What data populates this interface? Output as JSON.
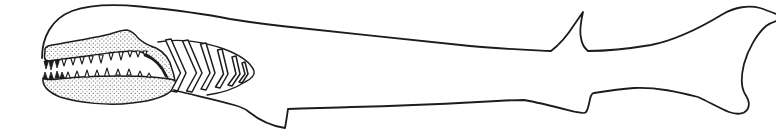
{
  "figure": {
    "kind": "black-and-white scientific line drawing",
    "background_color": "#ffffff",
    "ink_color": "#1c1c1c",
    "gill_arch_count": 6,
    "upper_tooth_count": 13,
    "lower_tooth_count": 13,
    "parts": [
      "head-and-back-outline",
      "upper-jaw",
      "lower-jaw",
      "upper-teeth",
      "lower-teeth",
      "mouth-corner",
      "gill-basket",
      "gill-arches",
      "pectoral-fin",
      "dorsal-fin",
      "pelvic-fin",
      "caudal-fin",
      "belly-outline"
    ]
  }
}
